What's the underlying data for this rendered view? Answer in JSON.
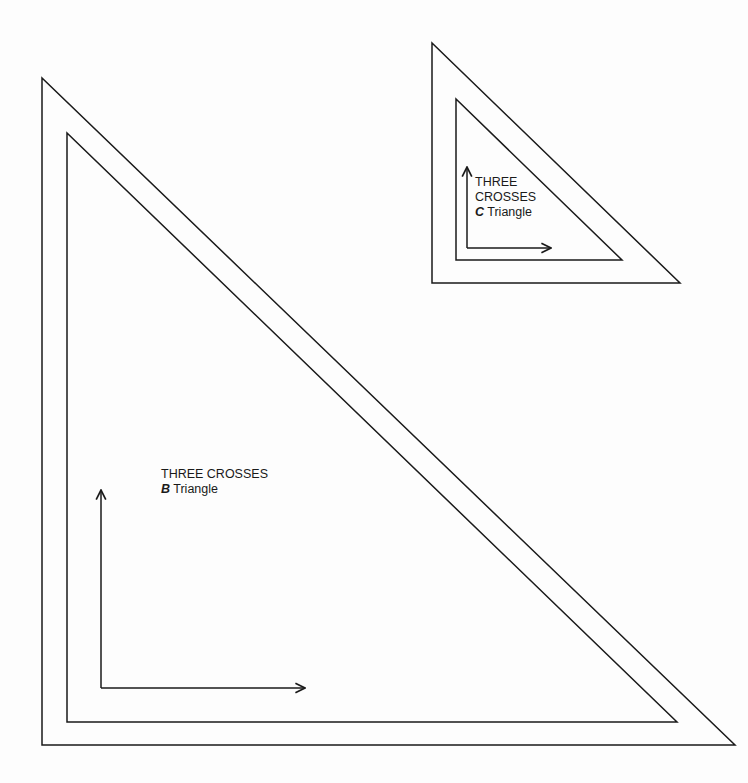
{
  "diagram": {
    "type": "template pattern pieces",
    "stroke_color": "#1a1a1a",
    "background": "#fdfdfd"
  },
  "pieces": [
    {
      "id": "B",
      "title_line1": "THREE CROSSES",
      "letter": "B",
      "suffix": "Triangle",
      "outer_triangle": [
        [
          42,
          78
        ],
        [
          42,
          745
        ],
        [
          735,
          745
        ]
      ],
      "inner_triangle": [
        [
          67,
          133
        ],
        [
          67,
          722
        ],
        [
          677,
          722
        ]
      ],
      "grain_arrow_vertical": {
        "x": 101,
        "y_top": 490,
        "y_bottom": 688
      },
      "grain_arrow_horizontal": {
        "y": 688,
        "x_left": 101,
        "x_right": 305
      }
    },
    {
      "id": "C",
      "title_line1": "THREE",
      "title_line2": "CROSSES",
      "letter": "C",
      "suffix": "Triangle",
      "outer_triangle": [
        [
          432,
          43
        ],
        [
          432,
          283
        ],
        [
          680,
          283
        ]
      ],
      "inner_triangle": [
        [
          456,
          99
        ],
        [
          456,
          260
        ],
        [
          622,
          260
        ]
      ],
      "grain_arrow_vertical": {
        "x": 467,
        "y_top": 167,
        "y_bottom": 248
      },
      "grain_arrow_horizontal": {
        "y": 248,
        "x_left": 467,
        "x_right": 551
      }
    }
  ]
}
